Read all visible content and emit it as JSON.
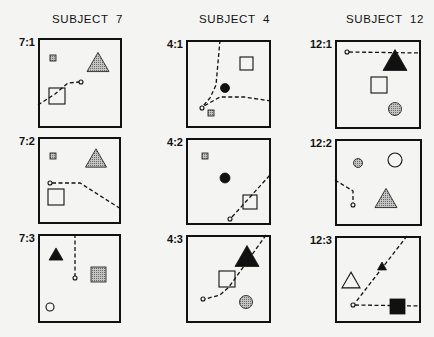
{
  "colors": {
    "ink": "#111111",
    "stipple": "#9a9a9a",
    "paper": "#f4f4f2"
  },
  "headers": [
    {
      "label": "SUBJECT  7",
      "x": 40
    },
    {
      "label": "SUBJECT  4",
      "x": 187
    },
    {
      "label": "SUBJECT  12",
      "x": 334
    }
  ],
  "panels": [
    {
      "id": "7-1",
      "label": "7:1",
      "x": 38,
      "y": 38,
      "w": 84,
      "h": 90,
      "shapes": [
        {
          "type": "square",
          "style": "stipple",
          "x": 12,
          "y": 17,
          "s": 6
        },
        {
          "type": "triangle",
          "style": "stipple",
          "cx": 60,
          "cy": 24,
          "s": 22
        },
        {
          "type": "square",
          "style": "open",
          "x": 11,
          "y": 50,
          "s": 16
        },
        {
          "type": "circle",
          "style": "open",
          "cx": 43,
          "cy": 44,
          "r": 2
        }
      ],
      "paths": [
        "M0,67 L17,56 L30,45 L41,44"
      ]
    },
    {
      "id": "4-1",
      "label": "4:1",
      "x": 186,
      "y": 40,
      "w": 85,
      "h": 88,
      "shapes": [
        {
          "type": "square",
          "style": "open",
          "x": 54,
          "y": 17,
          "s": 13
        },
        {
          "type": "circle",
          "style": "filled",
          "cx": 39,
          "cy": 48,
          "r": 4.5
        },
        {
          "type": "circle",
          "style": "open",
          "cx": 16,
          "cy": 68,
          "r": 2
        },
        {
          "type": "square",
          "style": "stipple",
          "x": 22,
          "y": 70,
          "s": 6
        }
      ],
      "paths": [
        "M34,0 L30,45 L24,58 L17,66",
        "M85,61 L58,57 L34,57 L18,66"
      ]
    },
    {
      "id": "12-1",
      "label": "12:1",
      "x": 335,
      "y": 40,
      "w": 86,
      "h": 89,
      "shapes": [
        {
          "type": "circle",
          "style": "open",
          "cx": 12,
          "cy": 12,
          "r": 2
        },
        {
          "type": "triangle",
          "style": "filled",
          "cx": 60,
          "cy": 20,
          "s": 24
        },
        {
          "type": "square",
          "style": "open",
          "x": 36,
          "y": 37,
          "s": 16
        },
        {
          "type": "circle",
          "style": "stipple",
          "cx": 60,
          "cy": 69,
          "r": 6.5
        }
      ],
      "paths": [
        "M14,12 L86,13"
      ]
    },
    {
      "id": "7-2",
      "label": "7:2",
      "x": 38,
      "y": 137,
      "w": 83,
      "h": 87,
      "shapes": [
        {
          "type": "square",
          "style": "stipple",
          "x": 12,
          "y": 16,
          "s": 6
        },
        {
          "type": "triangle",
          "style": "stipple",
          "cx": 58,
          "cy": 21,
          "s": 21
        },
        {
          "type": "circle",
          "style": "open",
          "cx": 12,
          "cy": 46,
          "r": 2
        },
        {
          "type": "square",
          "style": "open",
          "x": 10,
          "y": 52,
          "s": 16
        }
      ],
      "paths": [
        "M14,46 L42,46 L83,72"
      ]
    },
    {
      "id": "4-2",
      "label": "4:2",
      "x": 186,
      "y": 138,
      "w": 85,
      "h": 87,
      "shapes": [
        {
          "type": "square",
          "style": "stipple",
          "x": 16,
          "y": 15,
          "s": 6
        },
        {
          "type": "circle",
          "style": "filled",
          "cx": 39,
          "cy": 40,
          "r": 5
        },
        {
          "type": "square",
          "style": "open",
          "x": 57,
          "y": 57,
          "s": 14
        },
        {
          "type": "circle",
          "style": "open",
          "cx": 44,
          "cy": 81,
          "r": 2
        }
      ],
      "paths": [
        "M46,79 L84,37"
      ]
    },
    {
      "id": "12-2",
      "label": "12:2",
      "x": 335,
      "y": 139,
      "w": 87,
      "h": 87,
      "shapes": [
        {
          "type": "circle",
          "style": "stipple",
          "cx": 23,
          "cy": 24,
          "r": 4.5
        },
        {
          "type": "circle",
          "style": "open",
          "cx": 60,
          "cy": 21,
          "r": 7
        },
        {
          "type": "triangle",
          "style": "stipple",
          "cx": 51,
          "cy": 59,
          "s": 22
        },
        {
          "type": "circle",
          "style": "open",
          "cx": 18,
          "cy": 66,
          "r": 2
        }
      ],
      "paths": [
        "M0,41 L18,52 L18,64"
      ]
    },
    {
      "id": "7-3",
      "label": "7:3",
      "x": 38,
      "y": 234,
      "w": 83,
      "h": 89,
      "shapes": [
        {
          "type": "triangle",
          "style": "filled",
          "cx": 18,
          "cy": 20,
          "s": 14
        },
        {
          "type": "square",
          "style": "stipple",
          "x": 53,
          "y": 33,
          "s": 15
        },
        {
          "type": "circle",
          "style": "open",
          "cx": 37,
          "cy": 44,
          "r": 2
        },
        {
          "type": "circle",
          "style": "open",
          "cx": 12,
          "cy": 73,
          "r": 4
        }
      ],
      "paths": [
        "M37,0 L37,42"
      ]
    },
    {
      "id": "4-3",
      "label": "4:3",
      "x": 186,
      "y": 235,
      "w": 85,
      "h": 88,
      "shapes": [
        {
          "type": "triangle",
          "style": "filled",
          "cx": 61,
          "cy": 21,
          "s": 24
        },
        {
          "type": "square",
          "style": "open",
          "x": 33,
          "y": 36,
          "s": 16
        },
        {
          "type": "circle",
          "style": "open",
          "cx": 17,
          "cy": 64,
          "r": 2
        },
        {
          "type": "circle",
          "style": "stipple",
          "cx": 60,
          "cy": 67,
          "r": 6.5
        }
      ],
      "paths": [
        "M80,0 L43,52 L34,60 L19,64"
      ]
    },
    {
      "id": "12-3",
      "label": "12:3",
      "x": 335,
      "y": 236,
      "w": 86,
      "h": 87,
      "shapes": [
        {
          "type": "triangle",
          "style": "open",
          "cx": 16,
          "cy": 44,
          "s": 18
        },
        {
          "type": "triangle",
          "style": "filled",
          "cx": 47,
          "cy": 30,
          "s": 9
        },
        {
          "type": "circle",
          "style": "open",
          "cx": 18,
          "cy": 69,
          "r": 2
        },
        {
          "type": "square",
          "style": "filled",
          "x": 55,
          "y": 63,
          "s": 15
        }
      ],
      "paths": [
        "M72,0 L20,67",
        "M20,69 L86,70"
      ]
    }
  ]
}
